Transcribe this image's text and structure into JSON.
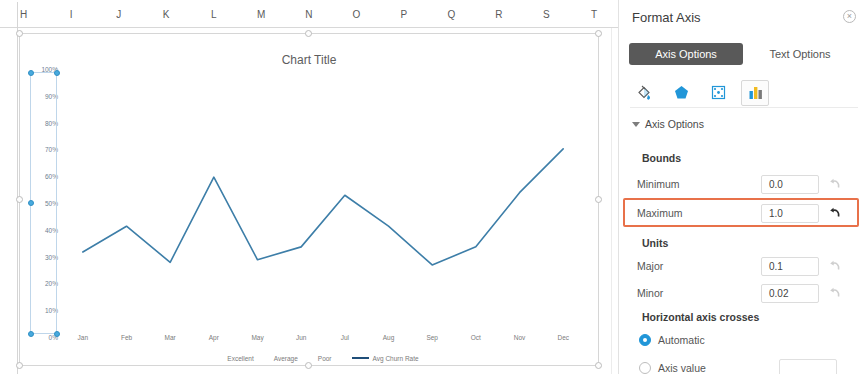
{
  "spreadsheet": {
    "columns": [
      "H",
      "I",
      "J",
      "K",
      "L",
      "M",
      "N",
      "O",
      "P",
      "Q",
      "R",
      "S",
      "T"
    ]
  },
  "chart": {
    "title": "Chart Title",
    "series_color": "#3d7ea8",
    "legend_line_color": "#1f4e79"
  },
  "chart_data": {
    "type": "line",
    "title": "Chart Title",
    "xlabel": "",
    "ylabel": "",
    "grid": false,
    "legend_position": "bottom",
    "categories": [
      "Jan",
      "Feb",
      "Mar",
      "Apr",
      "May",
      "Jun",
      "Jul",
      "Aug",
      "Sep",
      "Oct",
      "Nov",
      "Dec"
    ],
    "ytick_labels": [
      "100%",
      "90%",
      "80%",
      "70%",
      "60%",
      "50%",
      "40%",
      "30%",
      "20%",
      "10%",
      "0%"
    ],
    "ytick_values": [
      100,
      90,
      80,
      70,
      60,
      50,
      40,
      30,
      20,
      10,
      0
    ],
    "ylim": [
      0,
      100
    ],
    "legend": [
      "Excellent",
      "Average",
      "Poor",
      "Avg Churn Rate"
    ],
    "series": [
      {
        "name": "Avg Churn Rate",
        "type": "line",
        "color": "#3d7ea8",
        "values": [
          31,
          41,
          27,
          60,
          28,
          33,
          53,
          41,
          26,
          33,
          54,
          71
        ]
      }
    ]
  },
  "panel": {
    "title": "Format Axis",
    "close_label": "×",
    "tabs": [
      {
        "label": "Axis Options",
        "active": true
      },
      {
        "label": "Text Options",
        "active": false
      }
    ],
    "icons": [
      {
        "name": "fill-and-line-icon",
        "active": false
      },
      {
        "name": "effects-icon",
        "active": false
      },
      {
        "name": "size-and-properties-icon",
        "active": false
      },
      {
        "name": "axis-options-chart-icon",
        "active": true
      }
    ],
    "section": {
      "label": "Axis Options",
      "expanded": true
    },
    "bounds": {
      "group_label": "Bounds",
      "minimum_label": "Minimum",
      "minimum_value": "0.0",
      "maximum_label": "Maximum",
      "maximum_value": "1.0"
    },
    "units": {
      "group_label": "Units",
      "major_label": "Major",
      "major_value": "0.1",
      "minor_label": "Minor",
      "minor_value": "0.02"
    },
    "crosses": {
      "group_label": "Horizontal axis crosses",
      "automatic_label": "Automatic",
      "axis_value_label": "Axis value",
      "axis_value_input": "",
      "selected": "Automatic"
    },
    "highlight_color": "#e8714a"
  }
}
